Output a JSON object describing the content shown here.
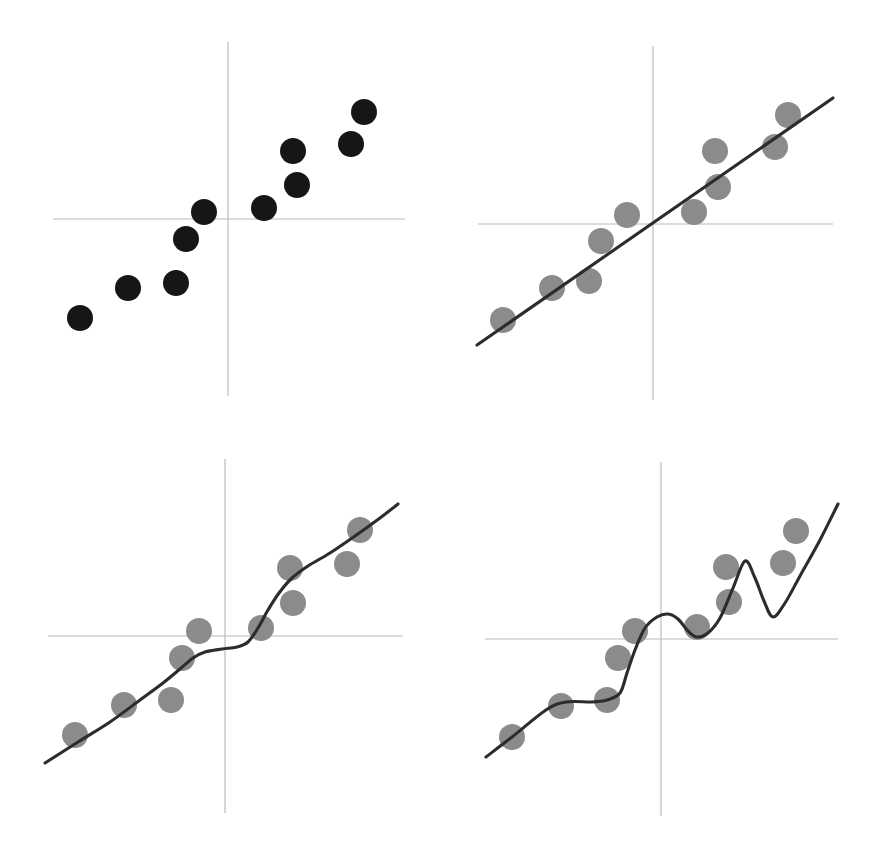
{
  "figure": {
    "width": 875,
    "height": 857,
    "background_color": "#ffffff",
    "layout": "2x2 grid of scatter plots illustrating model fitting",
    "panel_labels_visible": false,
    "axis_color": "#b9b9b9",
    "curve_color": "#2c2c2c",
    "dark_point_color": "#161616",
    "gray_point_color": "#8b8b8b"
  },
  "chart_data": [
    {
      "id": "panel-1",
      "type": "scatter",
      "title": "",
      "subtitle": "",
      "xlabel": "",
      "ylabel": "",
      "grid": false,
      "legend": "none",
      "axis_style": "crosshair axes through origin, no tick labels",
      "origin_px": [
        228,
        219
      ],
      "x_axis_extent_px": [
        53,
        405
      ],
      "y_axis_extent_px": [
        42,
        396
      ],
      "point_radius_px": 13,
      "point_color": "#161616",
      "point_style": "filled-circle",
      "has_fit_curve": false,
      "points_px": [
        [
          80,
          318
        ],
        [
          128,
          288
        ],
        [
          176,
          283
        ],
        [
          186,
          239
        ],
        [
          204,
          212
        ],
        [
          264,
          208
        ],
        [
          297,
          185
        ],
        [
          293,
          151
        ],
        [
          351,
          144
        ],
        [
          364,
          112
        ]
      ]
    },
    {
      "id": "panel-2",
      "type": "scatter",
      "title": "",
      "subtitle": "",
      "xlabel": "",
      "ylabel": "",
      "grid": false,
      "legend": "none",
      "axis_style": "crosshair axes through origin, no tick labels",
      "origin_px": [
        653,
        224
      ],
      "x_axis_extent_px": [
        478,
        833
      ],
      "y_axis_extent_px": [
        46,
        400
      ],
      "point_radius_px": 13,
      "point_color": "#8b8b8b",
      "point_style": "filled-circle",
      "has_fit_curve": true,
      "fit_type": "linear",
      "fit_description": "straight least-squares regression line, underfits",
      "fit_path_px": [
        [
          477,
          345
        ],
        [
          833,
          98
        ]
      ],
      "points_px": [
        [
          503,
          320
        ],
        [
          552,
          288
        ],
        [
          601,
          241
        ],
        [
          589,
          281
        ],
        [
          627,
          215
        ],
        [
          694,
          212
        ],
        [
          718,
          187
        ],
        [
          715,
          151
        ],
        [
          775,
          147
        ],
        [
          788,
          115
        ]
      ]
    },
    {
      "id": "panel-3",
      "type": "scatter",
      "title": "",
      "subtitle": "",
      "xlabel": "",
      "ylabel": "",
      "grid": false,
      "legend": "none",
      "axis_style": "crosshair axes through origin, no tick labels",
      "origin_px": [
        225,
        636
      ],
      "x_axis_extent_px": [
        48,
        403
      ],
      "y_axis_extent_px": [
        459,
        813
      ],
      "point_radius_px": 13,
      "point_color": "#8b8b8b",
      "point_style": "filled-circle",
      "has_fit_curve": true,
      "fit_type": "smooth-spline",
      "fit_description": "gently curved smoothing fit with a flat plateau near the origin, good fit",
      "fit_path_px": [
        [
          45,
          763
        ],
        [
          78,
          742
        ],
        [
          110,
          722
        ],
        [
          140,
          700
        ],
        [
          163,
          683
        ],
        [
          180,
          669
        ],
        [
          193,
          658
        ],
        [
          205,
          652
        ],
        [
          222,
          649
        ],
        [
          237,
          647
        ],
        [
          248,
          642
        ],
        [
          258,
          628
        ],
        [
          268,
          610
        ],
        [
          279,
          593
        ],
        [
          292,
          578
        ],
        [
          308,
          566
        ],
        [
          330,
          553
        ],
        [
          355,
          536
        ],
        [
          380,
          518
        ],
        [
          398,
          504
        ]
      ],
      "points_px": [
        [
          75,
          735
        ],
        [
          124,
          705
        ],
        [
          171,
          700
        ],
        [
          182,
          658
        ],
        [
          199,
          631
        ],
        [
          261,
          628
        ],
        [
          293,
          603
        ],
        [
          290,
          568
        ],
        [
          347,
          564
        ],
        [
          360,
          530
        ]
      ]
    },
    {
      "id": "panel-4",
      "type": "scatter",
      "title": "",
      "subtitle": "",
      "xlabel": "",
      "ylabel": "",
      "grid": false,
      "legend": "none",
      "axis_style": "crosshair axes through origin, no tick labels",
      "origin_px": [
        661,
        639
      ],
      "x_axis_extent_px": [
        485,
        838
      ],
      "y_axis_extent_px": [
        462,
        816
      ],
      "point_radius_px": 13,
      "point_color": "#8b8b8b",
      "point_style": "filled-circle",
      "has_fit_curve": true,
      "fit_type": "interpolating-wiggly",
      "fit_description": "high-variance wiggly curve threading through every point, overfits",
      "fit_path_px": [
        [
          486,
          757
        ],
        [
          512,
          737
        ],
        [
          546,
          710
        ],
        [
          566,
          702
        ],
        [
          592,
          702
        ],
        [
          607,
          700
        ],
        [
          620,
          693
        ],
        [
          627,
          673
        ],
        [
          635,
          650
        ],
        [
          645,
          628
        ],
        [
          657,
          617
        ],
        [
          668,
          614
        ],
        [
          678,
          619
        ],
        [
          688,
          631
        ],
        [
          697,
          637
        ],
        [
          708,
          633
        ],
        [
          720,
          618
        ],
        [
          733,
          588
        ],
        [
          745,
          561
        ],
        [
          755,
          578
        ],
        [
          764,
          601
        ],
        [
          773,
          617
        ],
        [
          785,
          603
        ],
        [
          800,
          576
        ],
        [
          820,
          540
        ],
        [
          838,
          504
        ]
      ],
      "points_px": [
        [
          512,
          737
        ],
        [
          561,
          706
        ],
        [
          607,
          700
        ],
        [
          618,
          658
        ],
        [
          635,
          631
        ],
        [
          697,
          627
        ],
        [
          729,
          602
        ],
        [
          726,
          567
        ],
        [
          783,
          563
        ],
        [
          796,
          531
        ]
      ]
    }
  ]
}
